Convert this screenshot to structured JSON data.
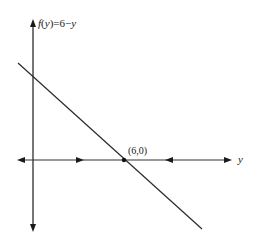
{
  "diagram": {
    "function_label": "f(y)=6−y",
    "function_label_parts": {
      "f": "f",
      "paren_open": "(",
      "y": "y",
      "paren_close_eq": ")=6−",
      "y2": "y"
    },
    "point_label": "(6,0)",
    "horizontal_axis_label": "y",
    "colors": {
      "axis": "#555555",
      "line": "#2a2a2a",
      "text": "#1a1a1a",
      "background": "#ffffff"
    },
    "geometry": {
      "vertical_axis_x": 33,
      "vertical_axis_top": 20,
      "vertical_axis_bottom": 231,
      "horizontal_axis_y": 160,
      "horizontal_axis_left": 17,
      "horizontal_axis_right": 232,
      "line_start": [
        18,
        63
      ],
      "line_end": [
        202,
        229
      ],
      "point": [
        124,
        160
      ]
    }
  }
}
